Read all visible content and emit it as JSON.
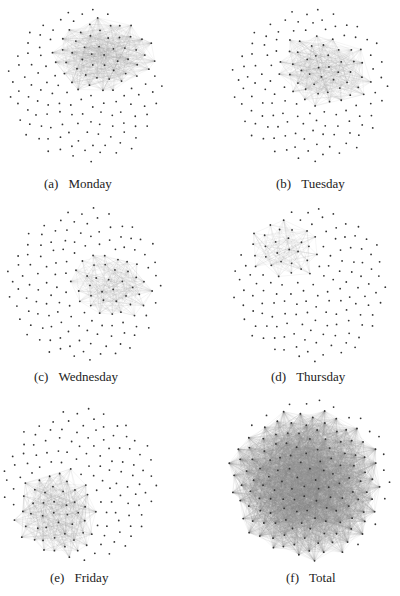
{
  "figure": {
    "panels": [
      {
        "id": "a",
        "label": "(a)",
        "title": "Monday",
        "cx": 85,
        "cy": 85,
        "r": 78,
        "cluster": {
          "cx": 105,
          "cy": 55,
          "rx": 55,
          "ry": 40,
          "rot": -10
        }
      },
      {
        "id": "b",
        "label": "(b)",
        "title": "Tuesday",
        "cx": 310,
        "cy": 85,
        "r": 78,
        "cluster": {
          "cx": 325,
          "cy": 70,
          "rx": 50,
          "ry": 38,
          "rot": 20
        }
      },
      {
        "id": "c",
        "label": "(c)",
        "title": "Wednesday",
        "cx": 85,
        "cy": 285,
        "r": 78,
        "cluster": {
          "cx": 110,
          "cy": 285,
          "rx": 45,
          "ry": 35,
          "rot": 15
        }
      },
      {
        "id": "d",
        "label": "(d)",
        "title": "Thursday",
        "cx": 310,
        "cy": 285,
        "r": 78,
        "cluster": {
          "cx": 285,
          "cy": 250,
          "rx": 38,
          "ry": 30,
          "rot": 10
        }
      },
      {
        "id": "e",
        "label": "(e)",
        "title": "Friday",
        "cx": 80,
        "cy": 485,
        "r": 78,
        "cluster": {
          "cx": 55,
          "cy": 515,
          "rx": 42,
          "ry": 50,
          "rot": 0
        }
      },
      {
        "id": "f",
        "label": "(f)",
        "title": "Total",
        "cx": 310,
        "cy": 480,
        "r": 82,
        "cluster": {
          "cx": 305,
          "cy": 485,
          "rx": 80,
          "ry": 78,
          "rot": 0
        }
      }
    ],
    "captions": {
      "a": {
        "label": "(a)",
        "text": "Monday"
      },
      "b": {
        "label": "(b)",
        "text": "Tuesday"
      },
      "c": {
        "label": "(c)",
        "text": "Wednesday"
      },
      "d": {
        "label": "(d)",
        "text": "Thursday"
      },
      "e": {
        "label": "(e)",
        "text": "Friday"
      },
      "f": {
        "label": "(f)",
        "text": "Total"
      }
    },
    "colors": {
      "node": "#333333",
      "edge": "#888888",
      "background": "#ffffff"
    }
  }
}
